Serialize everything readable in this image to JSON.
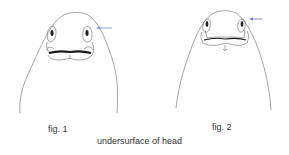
{
  "figures": [
    {
      "id": "fig1",
      "label": "fig. 1",
      "arrow_color": "#7b8fd6"
    },
    {
      "id": "fig2",
      "label": "fig. 2",
      "arrow_color": "#5f74d0"
    }
  ],
  "caption": "undersurface of head",
  "colors": {
    "outline": "#555555",
    "mouth": "#1a1a1a",
    "text": "#333333",
    "background": "#ffffff"
  }
}
